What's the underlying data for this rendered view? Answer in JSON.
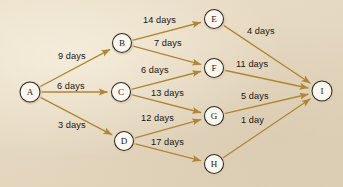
{
  "diagram": {
    "background_color": "#e6dac4",
    "edge_color": "#b08534",
    "node_fill_color": "#fbf7ee",
    "node_stroke_color": "#2e2a25",
    "label_color": "#17140f",
    "nodes": [
      {
        "id": "A",
        "label": "A",
        "x": 30,
        "y": 92,
        "r": 10
      },
      {
        "id": "B",
        "label": "B",
        "x": 122,
        "y": 43,
        "r": 9.5
      },
      {
        "id": "C",
        "label": "C",
        "x": 121,
        "y": 92,
        "r": 9.5
      },
      {
        "id": "D",
        "label": "D",
        "x": 124,
        "y": 141,
        "r": 9.5
      },
      {
        "id": "E",
        "label": "E",
        "x": 214,
        "y": 19,
        "r": 9.5
      },
      {
        "id": "F",
        "label": "F",
        "x": 214,
        "y": 68,
        "r": 9.5
      },
      {
        "id": "G",
        "label": "G",
        "x": 214,
        "y": 116,
        "r": 9.5
      },
      {
        "id": "H",
        "label": "H",
        "x": 214,
        "y": 164,
        "r": 9.5
      },
      {
        "id": "I",
        "label": "I",
        "x": 322,
        "y": 91,
        "r": 10
      }
    ],
    "edges": [
      {
        "from": "A",
        "to": "B",
        "label": "9 days",
        "duration": 9,
        "unit": "days",
        "lx": 58,
        "ly": 52
      },
      {
        "from": "A",
        "to": "C",
        "label": "6 days",
        "duration": 6,
        "unit": "days",
        "lx": 57,
        "ly": 82
      },
      {
        "from": "A",
        "to": "D",
        "label": "3 days",
        "duration": 3,
        "unit": "days",
        "lx": 58,
        "ly": 121
      },
      {
        "from": "B",
        "to": "E",
        "label": "14 days",
        "duration": 14,
        "unit": "days",
        "lx": 143,
        "ly": 16
      },
      {
        "from": "B",
        "to": "F",
        "label": "7 days",
        "duration": 7,
        "unit": "days",
        "lx": 154,
        "ly": 39
      },
      {
        "from": "C",
        "to": "F",
        "label": "6 days",
        "duration": 6,
        "unit": "days",
        "lx": 141,
        "ly": 66
      },
      {
        "from": "C",
        "to": "G",
        "label": "13 days",
        "duration": 13,
        "unit": "days",
        "lx": 151,
        "ly": 89
      },
      {
        "from": "D",
        "to": "G",
        "label": "12 days",
        "duration": 12,
        "unit": "days",
        "lx": 141,
        "ly": 114
      },
      {
        "from": "D",
        "to": "H",
        "label": "17 days",
        "duration": 17,
        "unit": "days",
        "lx": 151,
        "ly": 138
      },
      {
        "from": "E",
        "to": "I",
        "label": "4 days",
        "duration": 4,
        "unit": "days",
        "lx": 247,
        "ly": 27
      },
      {
        "from": "F",
        "to": "I",
        "label": "11 days",
        "duration": 11,
        "unit": "days",
        "lx": 236,
        "ly": 60
      },
      {
        "from": "G",
        "to": "I",
        "label": "5 days",
        "duration": 5,
        "unit": "days",
        "lx": 241,
        "ly": 92
      },
      {
        "from": "H",
        "to": "I",
        "label": "1 day",
        "duration": 1,
        "unit": "day",
        "lx": 241,
        "ly": 116
      }
    ]
  }
}
